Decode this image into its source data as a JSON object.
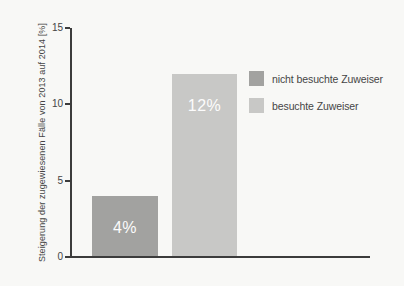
{
  "page": {
    "background": "#f8f8f6"
  },
  "colors": {
    "axis": "#3c3c3c",
    "tick_text": "#454545",
    "bar_label_text": "#fcfcfc",
    "bar_dark": "#a2a2a0",
    "bar_light": "#c8c8c6"
  },
  "chart_data": {
    "type": "bar",
    "title": "",
    "categories": [
      "nicht besuchte Zuweiser",
      "besuchte Zuweiser"
    ],
    "values": [
      4,
      12
    ],
    "bar_labels": [
      "4%",
      "12%"
    ],
    "bar_colors": [
      "#a2a2a0",
      "#c8c8c6"
    ],
    "xlabel": "",
    "ylabel": "Steigerung der zugewiesenen Fälle von 2013 auf 2014 [%]",
    "ylim": [
      0,
      15
    ],
    "yticks": [
      0,
      5,
      10,
      15
    ],
    "grid": false,
    "legend_position": "right",
    "legend": [
      {
        "label": "nicht besuchte Zuweiser",
        "color": "#a2a2a0"
      },
      {
        "label": "besuchte Zuweiser",
        "color": "#c8c8c6"
      }
    ]
  }
}
